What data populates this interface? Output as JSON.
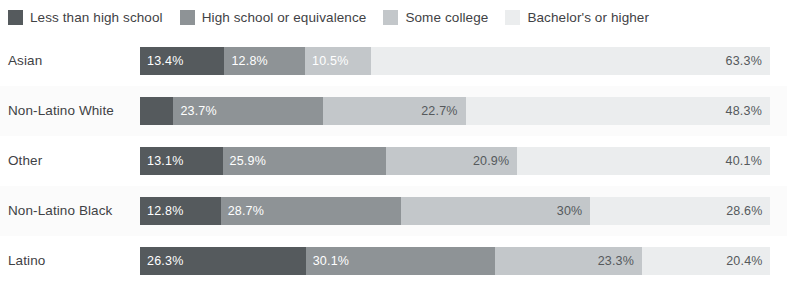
{
  "legend": {
    "items": [
      {
        "label": "Less than high school",
        "color": "#555a5d",
        "swatch_name": "legend-swatch-less-than-high-school"
      },
      {
        "label": "High school or equivalence",
        "color": "#8e9396",
        "swatch_name": "legend-swatch-high-school-or-equivalence"
      },
      {
        "label": "Some college",
        "color": "#c3c7ca",
        "swatch_name": "legend-swatch-some-college"
      },
      {
        "label": "Bachelor's or higher",
        "color": "#ebedee",
        "swatch_name": "legend-swatch-bachelors-or-higher"
      }
    ]
  },
  "chart_data": {
    "type": "bar",
    "orientation": "horizontal",
    "stacked": true,
    "normalized_percent": true,
    "title": "",
    "xlabel": "",
    "ylabel": "",
    "xlim": [
      0,
      100
    ],
    "grid": false,
    "legend_position": "top-left",
    "categories": [
      "Asian",
      "Non-Latino White",
      "Other",
      "Non-Latino Black",
      "Latino"
    ],
    "series": [
      {
        "name": "Less than high school",
        "color": "#555a5d",
        "values": [
          13.4,
          5.3,
          13.1,
          12.8,
          26.3
        ]
      },
      {
        "name": "High school or equivalence",
        "color": "#8e9396",
        "values": [
          12.8,
          23.7,
          25.9,
          28.7,
          30.1
        ]
      },
      {
        "name": "Some college",
        "color": "#c3c7ca",
        "values": [
          10.5,
          22.7,
          20.9,
          30.0,
          23.3
        ]
      },
      {
        "name": "Bachelor's or higher",
        "color": "#ebedee",
        "values": [
          63.3,
          48.3,
          40.1,
          28.6,
          20.4
        ]
      }
    ],
    "rows": [
      {
        "category": "Asian",
        "segments": [
          {
            "series": "Less than high school",
            "value": 13.4,
            "label": "13.4%",
            "label_visible": true,
            "label_color": "light",
            "label_align": "left"
          },
          {
            "series": "High school or equivalence",
            "value": 12.8,
            "label": "12.8%",
            "label_visible": true,
            "label_color": "light",
            "label_align": "left"
          },
          {
            "series": "Some college",
            "value": 10.5,
            "label": "10.5%",
            "label_visible": true,
            "label_color": "light",
            "label_align": "left"
          },
          {
            "series": "Bachelor's or higher",
            "value": 63.3,
            "label": "63.3%",
            "label_visible": true,
            "label_color": "dark",
            "label_align": "right"
          }
        ]
      },
      {
        "category": "Non-Latino White",
        "segments": [
          {
            "series": "Less than high school",
            "value": 5.3,
            "label": "",
            "label_visible": false,
            "label_color": "light",
            "label_align": "left"
          },
          {
            "series": "High school or equivalence",
            "value": 23.7,
            "label": "23.7%",
            "label_visible": true,
            "label_color": "light",
            "label_align": "left"
          },
          {
            "series": "Some college",
            "value": 22.7,
            "label": "22.7%",
            "label_visible": true,
            "label_color": "dark",
            "label_align": "right"
          },
          {
            "series": "Bachelor's or higher",
            "value": 48.3,
            "label": "48.3%",
            "label_visible": true,
            "label_color": "dark",
            "label_align": "right"
          }
        ]
      },
      {
        "category": "Other",
        "segments": [
          {
            "series": "Less than high school",
            "value": 13.1,
            "label": "13.1%",
            "label_visible": true,
            "label_color": "light",
            "label_align": "left"
          },
          {
            "series": "High school or equivalence",
            "value": 25.9,
            "label": "25.9%",
            "label_visible": true,
            "label_color": "light",
            "label_align": "left"
          },
          {
            "series": "Some college",
            "value": 20.9,
            "label": "20.9%",
            "label_visible": true,
            "label_color": "dark",
            "label_align": "right"
          },
          {
            "series": "Bachelor's or higher",
            "value": 40.1,
            "label": "40.1%",
            "label_visible": true,
            "label_color": "dark",
            "label_align": "right"
          }
        ]
      },
      {
        "category": "Non-Latino Black",
        "segments": [
          {
            "series": "Less than high school",
            "value": 12.8,
            "label": "12.8%",
            "label_visible": true,
            "label_color": "light",
            "label_align": "left"
          },
          {
            "series": "High school or equivalence",
            "value": 28.7,
            "label": "28.7%",
            "label_visible": true,
            "label_color": "light",
            "label_align": "left"
          },
          {
            "series": "Some college",
            "value": 30.0,
            "label": "30%",
            "label_visible": true,
            "label_color": "dark",
            "label_align": "right"
          },
          {
            "series": "Bachelor's or higher",
            "value": 28.6,
            "label": "28.6%",
            "label_visible": true,
            "label_color": "dark",
            "label_align": "right"
          }
        ]
      },
      {
        "category": "Latino",
        "segments": [
          {
            "series": "Less than high school",
            "value": 26.3,
            "label": "26.3%",
            "label_visible": true,
            "label_color": "light",
            "label_align": "left"
          },
          {
            "series": "High school or equivalence",
            "value": 30.1,
            "label": "30.1%",
            "label_visible": true,
            "label_color": "light",
            "label_align": "left"
          },
          {
            "series": "Some college",
            "value": 23.3,
            "label": "23.3%",
            "label_visible": true,
            "label_color": "dark",
            "label_align": "right"
          },
          {
            "series": "Bachelor's or higher",
            "value": 20.4,
            "label": "20.4%",
            "label_visible": true,
            "label_color": "dark",
            "label_align": "right"
          }
        ]
      }
    ]
  }
}
